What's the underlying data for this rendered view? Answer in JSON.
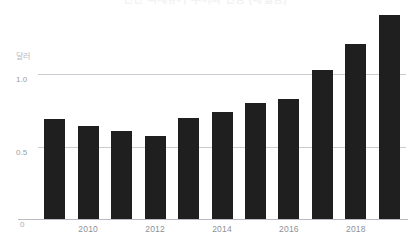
{
  "chart_data": {
    "type": "bar",
    "title": "연간 국제유가 추이와 전망 (배럴당)",
    "xlabel": "",
    "ylabel": "달러",
    "categories": [
      "2009",
      "2010",
      "2011",
      "2012",
      "2013",
      "2014",
      "2015",
      "2016",
      "2017",
      "2018",
      "2019"
    ],
    "values": [
      0.69,
      0.64,
      0.61,
      0.57,
      0.7,
      0.74,
      0.8,
      0.83,
      1.03,
      1.21,
      1.41
    ],
    "ylim": [
      0,
      1.55
    ],
    "y_ticks": [
      {
        "value": 0,
        "label": "0"
      },
      {
        "value": 0.5,
        "label": "0.5"
      },
      {
        "value": 1.0,
        "label": "1.0"
      }
    ],
    "x_ticks_shown": [
      "2010",
      "2012",
      "2014",
      "2016",
      "2018"
    ],
    "grid": true,
    "gridlines_at": [
      0.5,
      1.0
    ],
    "legend": null,
    "legend_position": "none",
    "bar_color": "#1f1f1f",
    "grid_color": "#c9ccd1",
    "axis_color": "#b9bcc2",
    "tick_label_color": "#8e9197",
    "background_color": "#ffffff"
  },
  "axes": {
    "y_unit_caption": "달러"
  }
}
